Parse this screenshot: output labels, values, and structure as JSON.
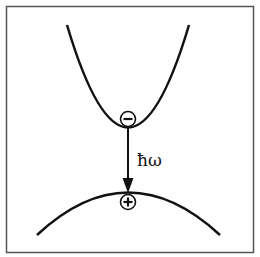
{
  "diagram": {
    "title": "",
    "conduction_band": {
      "charge_symbol": "−",
      "carrier": "electron"
    },
    "valence_band": {
      "charge_symbol": "+",
      "carrier": "hole"
    },
    "transition_label": "ħω",
    "colors": {
      "stroke": "#111111",
      "background": "#ffffff",
      "frame": "#555555"
    }
  }
}
